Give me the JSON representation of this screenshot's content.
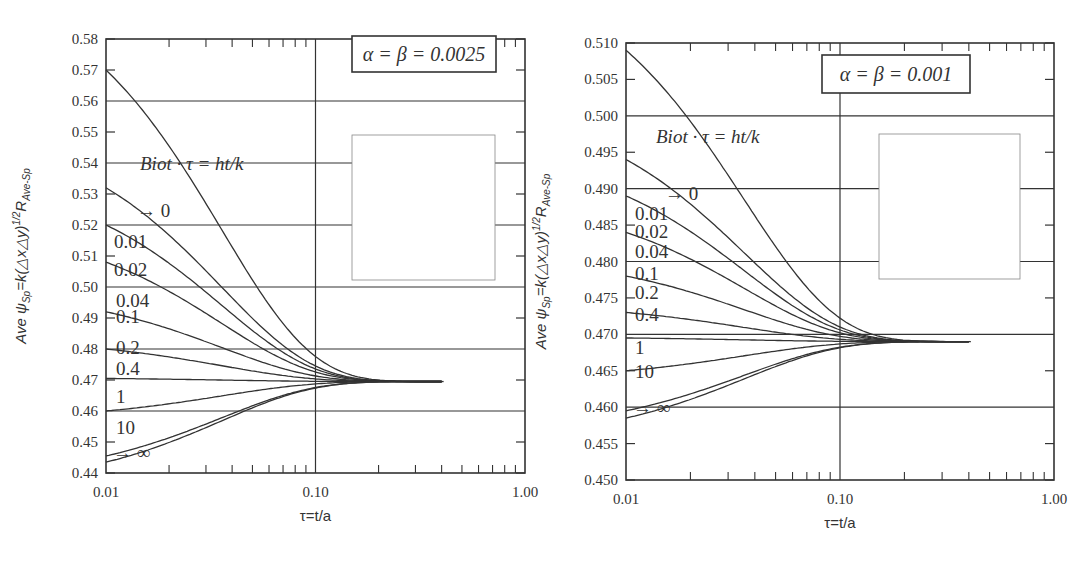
{
  "chart_data": [
    {
      "type": "line",
      "title": "α = β = 0.0025",
      "annotation": "Biot · τ = ht/k",
      "xlabel": "τ=t/a",
      "ylabel": "Ave ψSp=k(△x△y)^1/2 R Ave-Sp",
      "xscale": "log",
      "xlim": [
        0.01,
        1.0
      ],
      "ylim": [
        0.44,
        0.58
      ],
      "xticks": [
        "0.01",
        "0.10",
        "1.00"
      ],
      "yticks": [
        "0.44",
        "0.45",
        "0.46",
        "0.47",
        "0.48",
        "0.49",
        "0.50",
        "0.51",
        "0.52",
        "0.53",
        "0.54",
        "0.55",
        "0.56",
        "0.57",
        "0.58"
      ],
      "grid": true,
      "legend_position": "inline labels",
      "asymptote": 0.4695,
      "series": [
        {
          "name": "0",
          "label": "→ 0",
          "start": 0.57
        },
        {
          "name": "0.01",
          "label": "0.01",
          "start": 0.532
        },
        {
          "name": "0.02",
          "label": "0.02",
          "start": 0.52
        },
        {
          "name": "0.04",
          "label": "0.04",
          "start": 0.508
        },
        {
          "name": "0.1",
          "label": "0.1",
          "start": 0.492
        },
        {
          "name": "0.2",
          "label": "0.2",
          "start": 0.48
        },
        {
          "name": "0.4",
          "label": "0.4",
          "start": 0.4705
        },
        {
          "name": "1",
          "label": "1",
          "start": 0.46
        },
        {
          "name": "10",
          "label": "10",
          "start": 0.4455
        },
        {
          "name": "∞",
          "label": "→ ∞",
          "start": 0.4435
        }
      ],
      "x": [
        0.01,
        0.02,
        0.04,
        0.1,
        0.2,
        0.4,
        1.0
      ]
    },
    {
      "type": "line",
      "title": "α = β = 0.001",
      "annotation": "Biot · τ = ht/k",
      "xlabel": "τ=t/a",
      "ylabel": "Ave ψSp=k(△x△y)^1/2 R Ave-Sp",
      "xscale": "log",
      "xlim": [
        0.01,
        1.0
      ],
      "ylim": [
        0.45,
        0.51
      ],
      "xticks": [
        "0.01",
        "0.10",
        "1.00"
      ],
      "yticks": [
        "0.450",
        "0.455",
        "0.460",
        "0.465",
        "0.470",
        "0.475",
        "0.480",
        "0.485",
        "0.490",
        "0.495",
        "0.500",
        "0.505",
        "0.510"
      ],
      "grid": true,
      "legend_position": "inline labels",
      "asymptote": 0.469,
      "series": [
        {
          "name": "0",
          "label": "→ 0",
          "start": 0.509
        },
        {
          "name": "0.01",
          "label": "0.01",
          "start": 0.494
        },
        {
          "name": "0.02",
          "label": "0.02",
          "start": 0.489
        },
        {
          "name": "0.04",
          "label": "0.04",
          "start": 0.484
        },
        {
          "name": "0.1",
          "label": "0.1",
          "start": 0.478
        },
        {
          "name": "0.2",
          "label": "0.2",
          "start": 0.473
        },
        {
          "name": "0.4",
          "label": "0.4",
          "start": 0.4695
        },
        {
          "name": "1",
          "label": "1",
          "start": 0.465
        },
        {
          "name": "10",
          "label": "10",
          "start": 0.4595
        },
        {
          "name": "∞",
          "label": "→ ∞",
          "start": 0.4585
        }
      ],
      "x": [
        0.01,
        0.02,
        0.04,
        0.1,
        0.2,
        0.4,
        1.0
      ]
    }
  ],
  "charts": [
    {
      "title": "α = β = 0.0025",
      "annotation": "Biot · τ = ht/k",
      "xlabel": "τ=t/a",
      "ylabel_main": "Ave ψ",
      "ylabel_sub1": "Sp",
      "ylabel_mid": "=k(△x△y)",
      "ylabel_sup": "1/2",
      "ylabel_R": "R",
      "ylabel_sub2": "Ave-Sp",
      "labels": [
        "→ 0",
        "0.01",
        "0.02",
        "0.04",
        "0.1",
        "0.2",
        "0.4",
        "1",
        "10",
        "→ ∞"
      ]
    },
    {
      "title": "α = β = 0.001",
      "annotation": "Biot · τ = ht/k",
      "xlabel": "τ=t/a",
      "ylabel_main": "Ave ψ",
      "ylabel_sub1": "Sp",
      "ylabel_mid": "=k(△x△y)",
      "ylabel_sup": "1/2",
      "ylabel_R": "R",
      "ylabel_sub2": "Ave-Sp",
      "labels": [
        "→ 0",
        "0.01",
        "0.02",
        "0.04",
        "0.1",
        "0.2",
        "0.4",
        "1",
        "10",
        "→ ∞"
      ]
    }
  ],
  "colors": {
    "line": "#333333",
    "grid": "#333333",
    "background": "#ffffff"
  }
}
